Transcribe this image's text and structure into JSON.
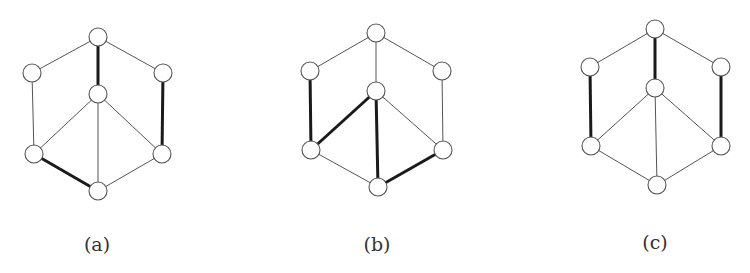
{
  "figure": {
    "background": "#ffffff",
    "node_radius": 9,
    "panels": [
      {
        "id": "a",
        "caption": "(a)",
        "caption_pos": [
          97,
          246
        ],
        "nodes": {
          "top": [
            98,
            37
          ],
          "upper_left": [
            32,
            73
          ],
          "upper_right": [
            163,
            73
          ],
          "center": [
            98,
            94
          ],
          "lower_left": [
            34,
            154
          ],
          "lower_right": [
            162,
            154
          ],
          "bottom": [
            98,
            191
          ]
        },
        "edges": [
          {
            "from": "top",
            "to": "upper_left",
            "bold": false
          },
          {
            "from": "top",
            "to": "upper_right",
            "bold": false
          },
          {
            "from": "top",
            "to": "center",
            "bold": true
          },
          {
            "from": "upper_left",
            "to": "lower_left",
            "bold": false
          },
          {
            "from": "upper_right",
            "to": "lower_right",
            "bold": true
          },
          {
            "from": "center",
            "to": "lower_left",
            "bold": false
          },
          {
            "from": "center",
            "to": "lower_right",
            "bold": false
          },
          {
            "from": "center",
            "to": "bottom",
            "bold": false
          },
          {
            "from": "lower_left",
            "to": "bottom",
            "bold": true
          },
          {
            "from": "lower_right",
            "to": "bottom",
            "bold": false
          }
        ]
      },
      {
        "id": "b",
        "caption": "(b)",
        "caption_pos": [
          377,
          246
        ],
        "nodes": {
          "top": [
            376,
            33
          ],
          "upper_left": [
            310,
            71
          ],
          "upper_right": [
            442,
            71
          ],
          "center": [
            376,
            91
          ],
          "lower_left": [
            311,
            150
          ],
          "lower_right": [
            443,
            150
          ],
          "bottom": [
            378,
            187
          ]
        },
        "edges": [
          {
            "from": "top",
            "to": "upper_left",
            "bold": false
          },
          {
            "from": "top",
            "to": "upper_right",
            "bold": false
          },
          {
            "from": "top",
            "to": "center",
            "bold": false
          },
          {
            "from": "upper_left",
            "to": "lower_left",
            "bold": true
          },
          {
            "from": "upper_right",
            "to": "lower_right",
            "bold": false
          },
          {
            "from": "center",
            "to": "lower_left",
            "bold": true
          },
          {
            "from": "center",
            "to": "lower_right",
            "bold": false
          },
          {
            "from": "center",
            "to": "bottom",
            "bold": true
          },
          {
            "from": "lower_left",
            "to": "bottom",
            "bold": false
          },
          {
            "from": "lower_right",
            "to": "bottom",
            "bold": true
          }
        ]
      },
      {
        "id": "c",
        "caption": "(c)",
        "caption_pos": [
          655,
          244
        ],
        "nodes": {
          "top": [
            655,
            29
          ],
          "upper_left": [
            590,
            67
          ],
          "upper_right": [
            721,
            67
          ],
          "center": [
            655,
            88
          ],
          "lower_left": [
            591,
            146
          ],
          "lower_right": [
            721,
            146
          ],
          "bottom": [
            657,
            185
          ]
        },
        "edges": [
          {
            "from": "top",
            "to": "upper_left",
            "bold": false
          },
          {
            "from": "top",
            "to": "upper_right",
            "bold": false
          },
          {
            "from": "top",
            "to": "center",
            "bold": true
          },
          {
            "from": "upper_left",
            "to": "lower_left",
            "bold": true
          },
          {
            "from": "upper_right",
            "to": "lower_right",
            "bold": true
          },
          {
            "from": "center",
            "to": "lower_left",
            "bold": false
          },
          {
            "from": "center",
            "to": "lower_right",
            "bold": false
          },
          {
            "from": "center",
            "to": "bottom",
            "bold": false
          },
          {
            "from": "lower_left",
            "to": "bottom",
            "bold": false
          },
          {
            "from": "lower_right",
            "to": "bottom",
            "bold": false
          }
        ]
      }
    ]
  }
}
